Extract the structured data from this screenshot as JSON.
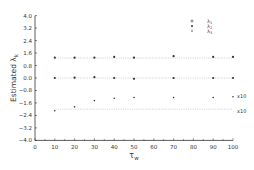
{
  "chart_data": {
    "type": "scatter",
    "title": "",
    "xlabel": "τ_w",
    "ylabel": "Estimated λ_k",
    "xlim": [
      0,
      100
    ],
    "ylim": [
      -4.0,
      4.0
    ],
    "xticks": [
      0,
      10,
      20,
      30,
      40,
      50,
      60,
      70,
      80,
      90,
      100
    ],
    "yticks": [
      4.0,
      3.2,
      2.4,
      1.6,
      0.8,
      0.0,
      -0.8,
      -1.6,
      -2.4,
      -3.2,
      -4.0
    ],
    "ytick_labels": [
      "4.0",
      "3.2",
      "2.4",
      "1.6",
      "0.8",
      "0.0",
      "−0.8",
      "−1.6",
      "−2.4",
      "−3.2",
      "−4.0"
    ],
    "grid": false,
    "legend_position": "top-right",
    "x": [
      10,
      20,
      30,
      40,
      50,
      70,
      90,
      100
    ],
    "series": [
      {
        "name": "λ1",
        "marker": "circle-dot",
        "values": [
          1.3,
          1.3,
          1.3,
          1.35,
          1.3,
          1.4,
          1.35,
          1.35
        ],
        "reference": 1.28
      },
      {
        "name": "λ2",
        "marker": "dot",
        "values": [
          0.0,
          0.02,
          0.05,
          0.0,
          -0.05,
          0.0,
          0.0,
          0.0
        ],
        "reference": 0.0
      },
      {
        "name": "λ3",
        "marker": "small-dot",
        "values": [
          -2.1,
          -1.85,
          -1.45,
          -1.3,
          -1.25,
          -1.25,
          -1.25,
          -1.2
        ],
        "reference": -2.0,
        "scale_note": "x10"
      }
    ],
    "annotations": [
      "x10",
      "x10"
    ]
  },
  "legend": [
    {
      "symbol": "◦",
      "label": "λ",
      "sub": "1"
    },
    {
      "symbol": "•",
      "label": "λ",
      "sub": "2"
    },
    {
      "symbol": "·",
      "label": "λ",
      "sub": "3"
    }
  ],
  "annotations": {
    "scale_estimate": "x10",
    "scale_reference": "x10"
  },
  "axes": {
    "ylabel_text": "Estimated λ",
    "ylabel_sub": "k",
    "xlabel_text": "τ",
    "xlabel_sub": "w"
  },
  "colors": {
    "axis": "#333333",
    "points": "#333333",
    "reference": "#999999"
  }
}
